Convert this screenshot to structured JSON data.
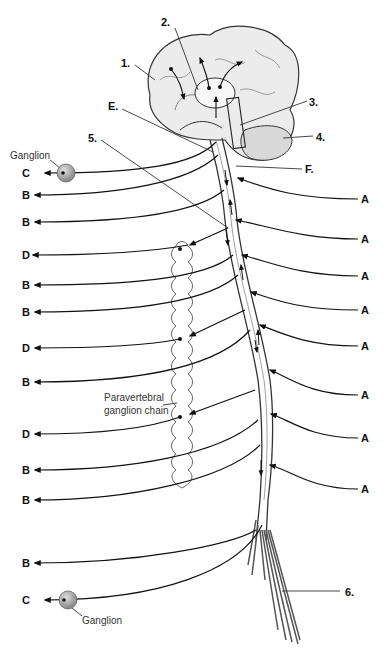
{
  "diagram": {
    "numbered_labels": [
      {
        "id": "1",
        "text": "1.",
        "x": 121,
        "y": 58
      },
      {
        "id": "2",
        "text": "2.",
        "x": 161,
        "y": 17
      },
      {
        "id": "3",
        "text": "3.",
        "x": 309,
        "y": 97
      },
      {
        "id": "4",
        "text": "4.",
        "x": 316,
        "y": 132
      },
      {
        "id": "5",
        "text": "5.",
        "x": 88,
        "y": 133
      },
      {
        "id": "6",
        "text": "6.",
        "x": 345,
        "y": 587
      }
    ],
    "letter_labels_top": [
      {
        "id": "E",
        "text": "E.",
        "x": 108,
        "y": 101
      },
      {
        "id": "F",
        "text": "F.",
        "x": 305,
        "y": 166
      }
    ],
    "left_labels": [
      {
        "text": "C",
        "y": 173
      },
      {
        "text": "B",
        "y": 195
      },
      {
        "text": "B",
        "y": 222
      },
      {
        "text": "D",
        "y": 255
      },
      {
        "text": "B",
        "y": 285
      },
      {
        "text": "B",
        "y": 312
      },
      {
        "text": "D",
        "y": 348
      },
      {
        "text": "B",
        "y": 382
      },
      {
        "text": "D",
        "y": 434
      },
      {
        "text": "B",
        "y": 470
      },
      {
        "text": "B",
        "y": 500
      },
      {
        "text": "B",
        "y": 563
      },
      {
        "text": "C",
        "y": 600
      }
    ],
    "right_labels": [
      {
        "text": "A",
        "y": 199
      },
      {
        "text": "A",
        "y": 239
      },
      {
        "text": "A",
        "y": 276
      },
      {
        "text": "A",
        "y": 310
      },
      {
        "text": "A",
        "y": 346
      },
      {
        "text": "A",
        "y": 395
      },
      {
        "text": "A",
        "y": 438
      },
      {
        "text": "A",
        "y": 489
      }
    ],
    "annotations": {
      "ganglion_top": "Ganglion",
      "ganglion_bottom": "Ganglion",
      "paravertebral_line1": "Paravertebral",
      "paravertebral_line2": "ganglion chain"
    }
  }
}
